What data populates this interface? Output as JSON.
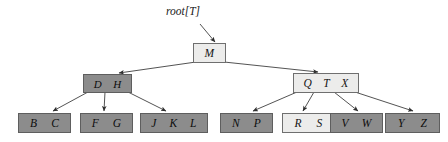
{
  "figure": {
    "kind": "b-tree-diagram",
    "root_pointer_label": "root[T]",
    "root_pointer_name": "root",
    "root_pointer_subscript": "[T]",
    "colors": {
      "page_background": "#ffffff",
      "dark_node_fill": "#8c8c8c",
      "light_node_fill": "#ececeb",
      "node_border": "#6d6d6d",
      "edge_line": "#3f3f3f",
      "text": "#111111"
    }
  },
  "tree": {
    "levels": [
      {
        "level": 1,
        "nodes": [
          {
            "id": "root",
            "keys": [
              "M"
            ],
            "shade": "light",
            "x": 193,
            "y": 43,
            "w": 33,
            "h": 20
          }
        ]
      },
      {
        "level": 2,
        "nodes": [
          {
            "id": "n-dh",
            "keys": [
              "D",
              "H"
            ],
            "shade": "dark",
            "x": 83,
            "y": 74,
            "w": 49,
            "h": 19
          },
          {
            "id": "n-qtx",
            "keys": [
              "Q",
              "T",
              "X"
            ],
            "shade": "light",
            "x": 293,
            "y": 73,
            "w": 66,
            "h": 20
          }
        ]
      },
      {
        "level": 3,
        "nodes": [
          {
            "id": "leaf-bc",
            "keys": [
              "B",
              "C"
            ],
            "shade": "dark",
            "x": 18,
            "y": 113,
            "w": 53,
            "h": 20
          },
          {
            "id": "leaf-fg",
            "keys": [
              "F",
              "G"
            ],
            "shade": "dark",
            "x": 80,
            "y": 113,
            "w": 53,
            "h": 20
          },
          {
            "id": "leaf-jkl",
            "keys": [
              "J",
              "K",
              "L"
            ],
            "shade": "dark",
            "x": 140,
            "y": 113,
            "w": 68,
            "h": 20
          },
          {
            "id": "leaf-np",
            "keys": [
              "N",
              "P"
            ],
            "shade": "dark",
            "x": 220,
            "y": 113,
            "w": 53,
            "h": 20
          },
          {
            "id": "leaf-rs",
            "keys": [
              "R",
              "S"
            ],
            "shade": "light",
            "x": 282,
            "y": 113,
            "w": 53,
            "h": 20
          },
          {
            "id": "leaf-vw",
            "keys": [
              "V",
              "W"
            ],
            "shade": "dark",
            "x": 330,
            "y": 113,
            "w": 53,
            "h": 20
          },
          {
            "id": "leaf-yz",
            "keys": [
              "Y",
              "Z"
            ],
            "shade": "dark",
            "x": 385,
            "y": 113,
            "w": 55,
            "h": 20
          }
        ]
      }
    ],
    "edges": [
      {
        "from": "root-pointer",
        "to": "root",
        "x1": 200,
        "y1": 24,
        "x2": 215,
        "y2": 42
      },
      {
        "from": "root",
        "to": "n-dh",
        "x1": 196,
        "y1": 62,
        "x2": 119,
        "y2": 73
      },
      {
        "from": "root",
        "to": "n-qtx",
        "x1": 224,
        "y1": 62,
        "x2": 318,
        "y2": 72
      },
      {
        "from": "n-dh",
        "to": "leaf-bc",
        "x1": 88,
        "y1": 92,
        "x2": 53,
        "y2": 111
      },
      {
        "from": "n-dh",
        "to": "leaf-fg",
        "x1": 105,
        "y1": 92,
        "x2": 104,
        "y2": 111
      },
      {
        "from": "n-dh",
        "to": "leaf-jkl",
        "x1": 128,
        "y1": 92,
        "x2": 166,
        "y2": 111
      },
      {
        "from": "n-qtx",
        "to": "leaf-np",
        "x1": 297,
        "y1": 92,
        "x2": 253,
        "y2": 111
      },
      {
        "from": "n-qtx",
        "to": "leaf-rs",
        "x1": 314,
        "y1": 92,
        "x2": 303,
        "y2": 111
      },
      {
        "from": "n-qtx",
        "to": "leaf-vw",
        "x1": 334,
        "y1": 92,
        "x2": 358,
        "y2": 111
      },
      {
        "from": "n-qtx",
        "to": "leaf-yz",
        "x1": 355,
        "y1": 92,
        "x2": 413,
        "y2": 111
      }
    ]
  },
  "root_label_pos": {
    "x": 166,
    "y": 5
  }
}
